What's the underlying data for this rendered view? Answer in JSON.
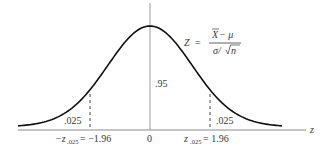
{
  "diagram": {
    "type": "normal-distribution",
    "formula": {
      "lhs": "Z",
      "equals": "=",
      "numerator_var": "X",
      "numerator_rest": " − μ",
      "denominator_sigma": "σ/",
      "denominator_n": "n"
    },
    "center_area_label": ".95",
    "left_tail_label": ".025",
    "right_tail_label": ".025",
    "axis_label": "z",
    "ticks": {
      "left": {
        "prefix": "−z",
        "sub": ".025",
        "value": " = −1.96"
      },
      "center": "0",
      "right": {
        "prefix": "z",
        "sub": ".025",
        "value": " = 1.96"
      }
    },
    "colors": {
      "curve": "#111111",
      "axis": "#888888",
      "text": "#3a3a3a"
    }
  }
}
